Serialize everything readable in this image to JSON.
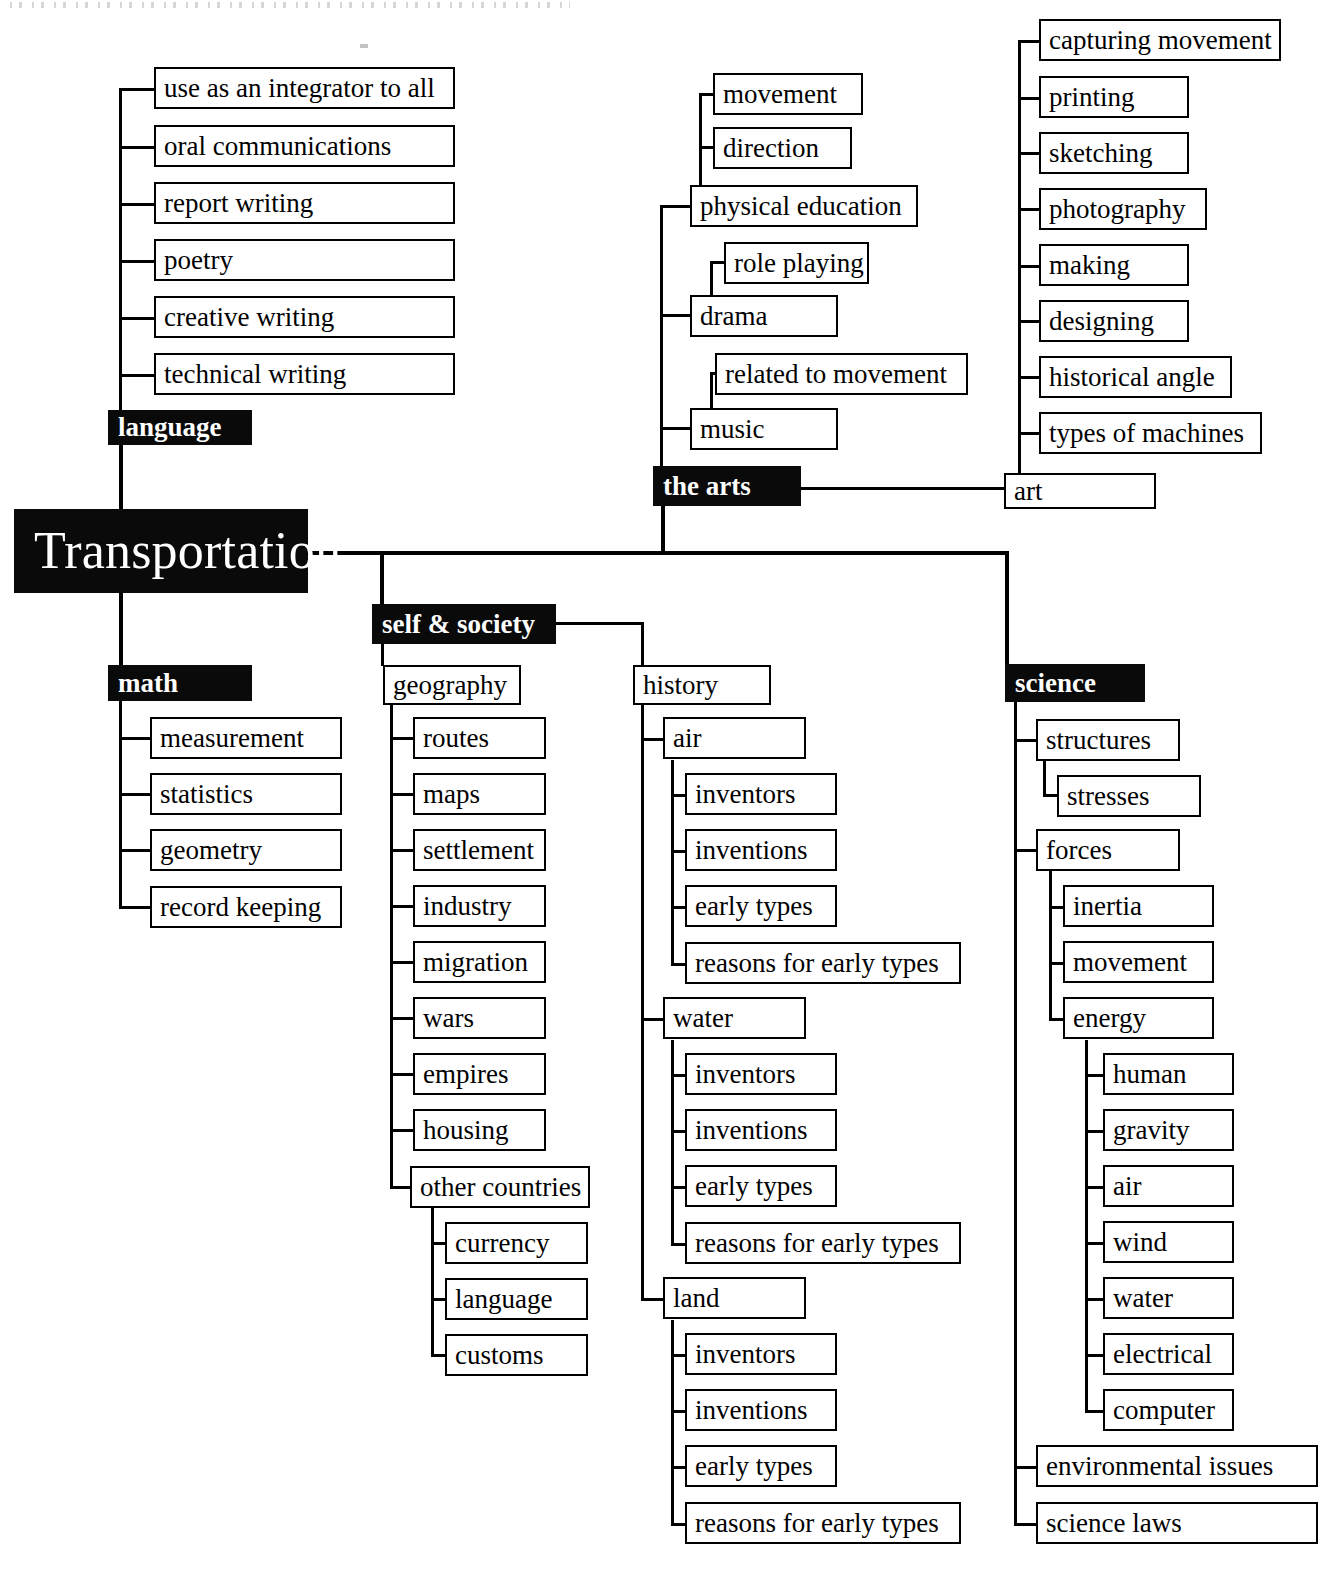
{
  "diagram": {
    "title": "Transportation",
    "type": "curriculum-web",
    "root": {
      "label": "Transportation",
      "style": "dark"
    },
    "branches": [
      {
        "key": "language",
        "label": "language",
        "style": "dark",
        "children": [
          {
            "label": "use as an integrator to all"
          },
          {
            "label": "oral communications"
          },
          {
            "label": "report writing"
          },
          {
            "label": "poetry"
          },
          {
            "label": "creative writing"
          },
          {
            "label": "technical writing"
          }
        ]
      },
      {
        "key": "the-arts",
        "label": "the arts",
        "style": "dark",
        "children": [
          {
            "label": "physical education",
            "children": [
              {
                "label": "movement"
              },
              {
                "label": "direction"
              }
            ]
          },
          {
            "label": "drama",
            "children": [
              {
                "label": "role playing"
              }
            ]
          },
          {
            "label": "music",
            "children": [
              {
                "label": "related to movement"
              }
            ]
          },
          {
            "label": "art",
            "children": [
              {
                "label": "capturing movement"
              },
              {
                "label": "printing"
              },
              {
                "label": "sketching"
              },
              {
                "label": "photography"
              },
              {
                "label": "making"
              },
              {
                "label": "designing"
              },
              {
                "label": "historical angle"
              },
              {
                "label": "types of machines"
              }
            ]
          }
        ]
      },
      {
        "key": "math",
        "label": "math",
        "style": "dark",
        "children": [
          {
            "label": "measurement"
          },
          {
            "label": "statistics"
          },
          {
            "label": "geometry"
          },
          {
            "label": "record keeping"
          }
        ]
      },
      {
        "key": "self-society",
        "label": "self & society",
        "style": "dark",
        "children": [
          {
            "label": "geography",
            "children": [
              {
                "label": "routes"
              },
              {
                "label": "maps"
              },
              {
                "label": "settlement"
              },
              {
                "label": "industry"
              },
              {
                "label": "migration"
              },
              {
                "label": "wars"
              },
              {
                "label": "empires"
              },
              {
                "label": "housing"
              },
              {
                "label": "other countries",
                "children": [
                  {
                    "label": "currency"
                  },
                  {
                    "label": "language"
                  },
                  {
                    "label": "customs"
                  }
                ]
              }
            ]
          },
          {
            "label": "history",
            "children": [
              {
                "label": "air",
                "children": [
                  {
                    "label": "inventors"
                  },
                  {
                    "label": "inventions"
                  },
                  {
                    "label": "early types"
                  },
                  {
                    "label": "reasons for early types"
                  }
                ]
              },
              {
                "label": "water",
                "children": [
                  {
                    "label": "inventors"
                  },
                  {
                    "label": "inventions"
                  },
                  {
                    "label": "early types"
                  },
                  {
                    "label": "reasons for early types"
                  }
                ]
              },
              {
                "label": "land",
                "children": [
                  {
                    "label": "inventors"
                  },
                  {
                    "label": "inventions"
                  },
                  {
                    "label": "early types"
                  },
                  {
                    "label": "reasons for early types"
                  }
                ]
              }
            ]
          }
        ]
      },
      {
        "key": "science",
        "label": "science",
        "style": "dark",
        "children": [
          {
            "label": "structures",
            "children": [
              {
                "label": "stresses"
              }
            ]
          },
          {
            "label": "forces",
            "children": [
              {
                "label": "inertia"
              },
              {
                "label": "movement"
              },
              {
                "label": "energy",
                "children": [
                  {
                    "label": "human"
                  },
                  {
                    "label": "gravity"
                  },
                  {
                    "label": "air"
                  },
                  {
                    "label": "wind"
                  },
                  {
                    "label": "water"
                  },
                  {
                    "label": "electrical"
                  },
                  {
                    "label": "computer"
                  }
                ]
              }
            ]
          },
          {
            "label": "environmental issues"
          },
          {
            "label": "science laws"
          }
        ]
      }
    ]
  },
  "nodes": {
    "root": "Transportation",
    "language": "language",
    "lang_integrator": "use as an integrator to all",
    "lang_oral": "oral communications",
    "lang_report": "report writing",
    "lang_poetry": "poetry",
    "lang_creative": "creative writing",
    "lang_technical": "technical writing",
    "arts": "the arts",
    "arts_pe": "physical education",
    "arts_movement": "movement",
    "arts_direction": "direction",
    "arts_drama": "drama",
    "arts_roleplaying": "role playing",
    "arts_music": "music",
    "arts_relatedmovement": "related to movement",
    "arts_art": "art",
    "art_capturing": "capturing movement",
    "art_printing": "printing",
    "art_sketching": "sketching",
    "art_photography": "photography",
    "art_making": "making",
    "art_designing": "designing",
    "art_historical": "historical angle",
    "art_machines": "types of machines",
    "math": "math",
    "math_measurement": "measurement",
    "math_statistics": "statistics",
    "math_geometry": "geometry",
    "math_record": "record keeping",
    "selfsociety": "self & society",
    "geography": "geography",
    "geo_routes": "routes",
    "geo_maps": "maps",
    "geo_settlement": "settlement",
    "geo_industry": "industry",
    "geo_migration": "migration",
    "geo_wars": "wars",
    "geo_empires": "empires",
    "geo_housing": "housing",
    "geo_other": "other countries",
    "oc_currency": "currency",
    "oc_language": "language",
    "oc_customs": "customs",
    "history": "history",
    "hist_air": "air",
    "air_inventors": "inventors",
    "air_inventions": "inventions",
    "air_early": "early types",
    "air_reasons": "reasons for early types",
    "hist_water": "water",
    "water_inventors": "inventors",
    "water_inventions": "inventions",
    "water_early": "early types",
    "water_reasons": "reasons for early types",
    "hist_land": "land",
    "land_inventors": "inventors",
    "land_inventions": "inventions",
    "land_early": "early types",
    "land_reasons": "reasons for early types",
    "science": "science",
    "sci_structures": "structures",
    "sci_stresses": "stresses",
    "sci_forces": "forces",
    "forces_inertia": "inertia",
    "forces_movement": "movement",
    "forces_energy": "energy",
    "energy_human": "human",
    "energy_gravity": "gravity",
    "energy_air": "air",
    "energy_wind": "wind",
    "energy_water": "water",
    "energy_electrical": "electrical",
    "energy_computer": "computer",
    "sci_environmental": "environmental issues",
    "sci_laws": "science laws"
  },
  "colors": {
    "ink": "#000000",
    "paper": "#ffffff",
    "node_fill_dark": "#0a0a0a",
    "node_text_dark": "#ffffff",
    "node_fill_light": "#ffffff",
    "node_text_light": "#000000"
  }
}
